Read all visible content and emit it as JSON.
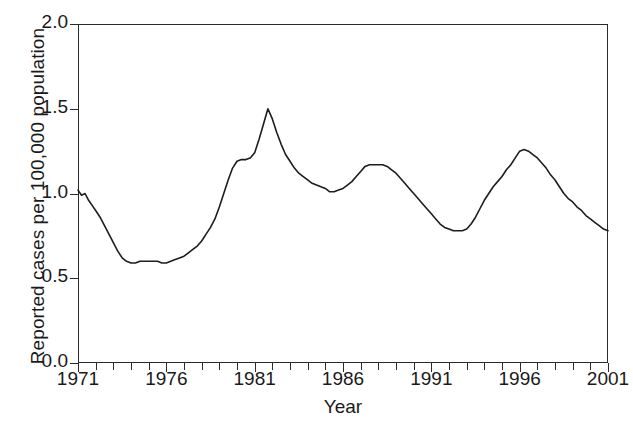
{
  "chart_data": {
    "type": "line",
    "title": "",
    "xlabel": "Year",
    "ylabel": "Reported cases per 100,000 population",
    "xlim": [
      1971,
      2001
    ],
    "ylim": [
      0.0,
      2.0
    ],
    "grid": false,
    "legend": false,
    "y_ticks": [
      {
        "value": 0.0,
        "label": "0.0"
      },
      {
        "value": 0.5,
        "label": "0.5"
      },
      {
        "value": 1.0,
        "label": "1.0"
      },
      {
        "value": 1.5,
        "label": "1.5"
      },
      {
        "value": 2.0,
        "label": "2.0"
      }
    ],
    "x_ticks_major": [
      {
        "value": 1971,
        "label": "1971"
      },
      {
        "value": 1976,
        "label": "1976"
      },
      {
        "value": 1981,
        "label": "1981"
      },
      {
        "value": 1986,
        "label": "1986"
      },
      {
        "value": 1991,
        "label": "1991"
      },
      {
        "value": 1996,
        "label": "1996"
      },
      {
        "value": 2001,
        "label": "2001"
      }
    ],
    "x_ticks_minor": [
      1972,
      1973,
      1974,
      1975,
      1977,
      1978,
      1979,
      1980,
      1982,
      1983,
      1984,
      1985,
      1987,
      1988,
      1989,
      1990,
      1992,
      1993,
      1994,
      1995,
      1997,
      1998,
      1999,
      2000
    ],
    "series": [
      {
        "name": "Reported cases per 100,000 population",
        "color": "#1d1d1d",
        "x": [
          1971.0,
          1971.2,
          1971.4,
          1971.6,
          1971.8,
          1972.0,
          1972.25,
          1972.5,
          1972.75,
          1973.0,
          1973.25,
          1973.5,
          1973.75,
          1974.0,
          1974.25,
          1974.5,
          1974.75,
          1975.0,
          1975.25,
          1975.5,
          1975.75,
          1976.0,
          1976.25,
          1976.5,
          1976.75,
          1977.0,
          1977.25,
          1977.5,
          1977.75,
          1978.0,
          1978.25,
          1978.5,
          1978.75,
          1979.0,
          1979.25,
          1979.5,
          1979.75,
          1980.0,
          1980.25,
          1980.5,
          1980.75,
          1981.0,
          1981.25,
          1981.5,
          1981.75,
          1982.0,
          1982.25,
          1982.5,
          1982.75,
          1983.0,
          1983.25,
          1983.5,
          1983.75,
          1984.0,
          1984.25,
          1984.5,
          1984.75,
          1985.0,
          1985.25,
          1985.5,
          1985.75,
          1986.0,
          1986.25,
          1986.5,
          1986.75,
          1987.0,
          1987.25,
          1987.5,
          1987.75,
          1988.0,
          1988.25,
          1988.5,
          1988.75,
          1989.0,
          1989.25,
          1989.5,
          1989.75,
          1990.0,
          1990.25,
          1990.5,
          1990.75,
          1991.0,
          1991.25,
          1991.5,
          1991.75,
          1992.0,
          1992.25,
          1992.5,
          1992.75,
          1993.0,
          1993.25,
          1993.5,
          1993.75,
          1994.0,
          1994.25,
          1994.5,
          1994.75,
          1995.0,
          1995.25,
          1995.5,
          1995.75,
          1996.0,
          1996.25,
          1996.5,
          1996.75,
          1997.0,
          1997.25,
          1997.5,
          1997.75,
          1998.0,
          1998.25,
          1998.5,
          1998.75,
          1999.0,
          1999.25,
          1999.5,
          1999.75,
          2000.0,
          2000.25,
          2000.5,
          2000.75,
          2001.0
        ],
        "y": [
          1.02,
          0.99,
          1.0,
          0.96,
          0.93,
          0.9,
          0.86,
          0.81,
          0.76,
          0.71,
          0.66,
          0.62,
          0.6,
          0.59,
          0.59,
          0.6,
          0.6,
          0.6,
          0.6,
          0.6,
          0.59,
          0.59,
          0.6,
          0.61,
          0.62,
          0.63,
          0.65,
          0.67,
          0.69,
          0.72,
          0.76,
          0.8,
          0.85,
          0.92,
          1.0,
          1.08,
          1.15,
          1.19,
          1.2,
          1.2,
          1.21,
          1.24,
          1.32,
          1.41,
          1.5,
          1.44,
          1.36,
          1.29,
          1.23,
          1.19,
          1.15,
          1.12,
          1.1,
          1.08,
          1.06,
          1.05,
          1.04,
          1.03,
          1.01,
          1.01,
          1.02,
          1.03,
          1.05,
          1.07,
          1.1,
          1.13,
          1.16,
          1.17,
          1.17,
          1.17,
          1.17,
          1.16,
          1.14,
          1.12,
          1.09,
          1.06,
          1.03,
          1.0,
          0.97,
          0.94,
          0.91,
          0.88,
          0.85,
          0.82,
          0.8,
          0.79,
          0.78,
          0.78,
          0.78,
          0.79,
          0.82,
          0.86,
          0.91,
          0.96,
          1.0,
          1.04,
          1.07,
          1.1,
          1.14,
          1.17,
          1.21,
          1.25,
          1.26,
          1.25,
          1.23,
          1.21,
          1.18,
          1.15,
          1.11,
          1.08,
          1.04,
          1.0,
          0.97,
          0.95,
          0.92,
          0.9,
          0.87,
          0.85,
          0.83,
          0.81,
          0.79,
          0.78
        ]
      }
    ]
  }
}
